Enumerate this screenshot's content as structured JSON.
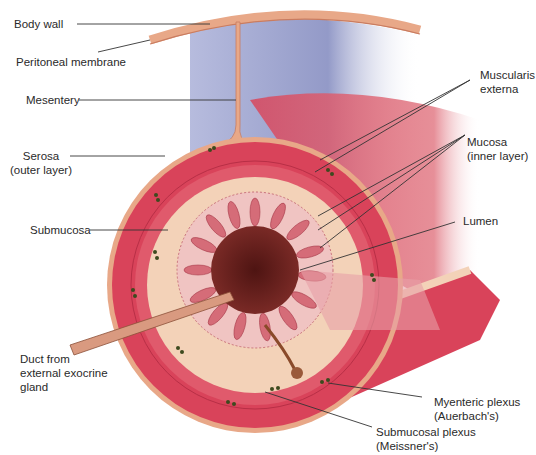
{
  "figure": {
    "colors": {
      "muscle": "#d9435a",
      "muscle_dark": "#b82f46",
      "submucosa": "#f3d2b8",
      "mucosa": "#f0b7bd",
      "lumen": "#6b1e1c",
      "serosa": "#e8a888",
      "cavity": "#8e96c7",
      "plexus": "#3d4a1e",
      "leader_line": "#333333"
    }
  },
  "labels": {
    "body_wall": "Body wall",
    "peritoneal_membrane": "Peritoneal membrane",
    "mesentery": "Mesentery",
    "serosa": [
      "Serosa",
      "(outer layer)"
    ],
    "submucosa": "Submucosa",
    "duct": [
      "Duct from",
      "external exocrine",
      "gland"
    ],
    "muscularis_externa": [
      "Muscularis",
      "externa"
    ],
    "mucosa": [
      "Mucosa",
      "(inner layer)"
    ],
    "lumen": "Lumen",
    "myenteric_plexus": [
      "Myenteric plexus",
      "(Auerbach's)"
    ],
    "submucosal_plexus": [
      "Submucosal plexus",
      "(Meissner's)"
    ]
  }
}
